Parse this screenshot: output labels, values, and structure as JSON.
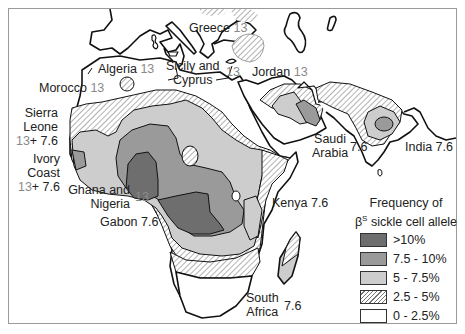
{
  "map": {
    "title": "Frequency of βS sickle cell allele",
    "legend": {
      "title_line1": "Frequency of",
      "title_beta": "β",
      "title_sup": "S",
      "title_line2_rest": " sickle cell allele",
      "items": [
        {
          "label": ">10%",
          "fill": "#6e6e6e",
          "pattern": "solid"
        },
        {
          "label": "7.5 - 10%",
          "fill": "#9a9a9a",
          "pattern": "solid"
        },
        {
          "label": "5 - 7.5%",
          "fill": "#cdcdcd",
          "pattern": "solid"
        },
        {
          "label": "2.5 - 5%",
          "fill": "#ffffff",
          "pattern": "hatch"
        },
        {
          "label": "0 - 2.5%",
          "fill": "#ffffff",
          "pattern": "none"
        }
      ]
    },
    "regions": [
      {
        "name": "Greece",
        "ref": "13"
      },
      {
        "name": "Algeria",
        "ref": "13"
      },
      {
        "name": "Sicily and Cyprus",
        "line1": "Sicily and",
        "line2": "Cyprus",
        "ref": "13"
      },
      {
        "name": "Jordan",
        "ref": "13"
      },
      {
        "name": "Morocco",
        "ref": "13"
      },
      {
        "name": "Sierra Leone",
        "line1": "Sierra",
        "line2": "Leone",
        "ref_gray": "13",
        "ref": "+ 7.6"
      },
      {
        "name": "Ivory Coast",
        "line1": "Ivory",
        "line2": "Coast",
        "ref_gray": "13",
        "ref": "+ 7.6"
      },
      {
        "name": "Ghana and Nigeria",
        "line1": "Ghana and",
        "line2": "Nigeria",
        "ref": "13"
      },
      {
        "name": "Gabon",
        "ref": "7.6"
      },
      {
        "name": "Saudi Arabia",
        "line1": "Saudi",
        "line2": "Arabia",
        "ref": "7.6"
      },
      {
        "name": "India",
        "ref": "7.6"
      },
      {
        "name": "Kenya",
        "ref": "7.6"
      },
      {
        "name": "South Africa",
        "line1": "South",
        "line2": "Africa",
        "ref": "7.6"
      }
    ]
  }
}
